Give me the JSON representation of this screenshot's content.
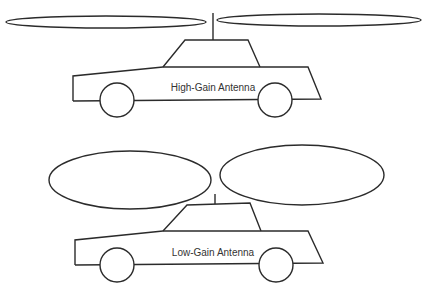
{
  "diagram": {
    "type": "antenna radiation pattern comparison",
    "panels": [
      {
        "id": "high-gain",
        "label": "High-Gain Antenna",
        "description": "Car with roof antenna; radiation pattern shown as two long, thin lobes extending horizontally left and right",
        "lobe_shape": "narrow, flat, long"
      },
      {
        "id": "low-gain",
        "label": "Low-Gain Antenna",
        "description": "Car with roof antenna; radiation pattern shown as two short, wide, rounded lobes on left and right",
        "lobe_shape": "wide, rounded, short"
      }
    ],
    "colors": {
      "stroke": "#2b2b2b",
      "text": "#333333",
      "background": "#ffffff"
    }
  }
}
